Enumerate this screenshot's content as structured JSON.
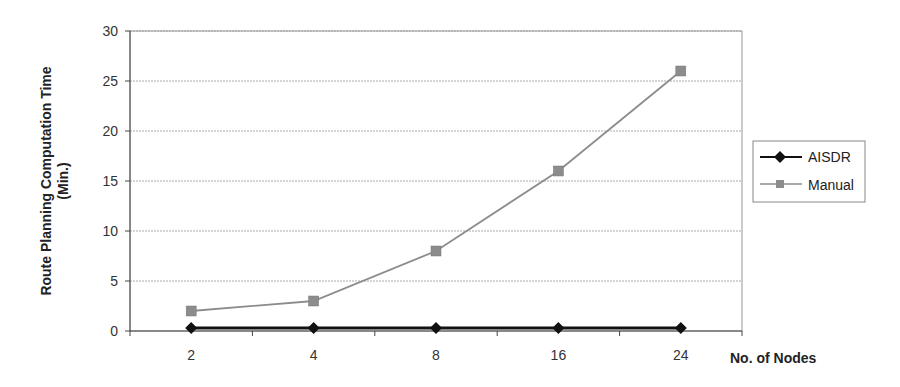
{
  "chart_data": {
    "type": "line",
    "title": "",
    "xlabel": "No. of Nodes",
    "ylabel": "Route Planning Computation Time (Min.)",
    "ylabel_lines": [
      "Route Planning Computation Time",
      "(Min.)"
    ],
    "categories": [
      "2",
      "4",
      "8",
      "16",
      "24"
    ],
    "ylim": [
      0,
      30
    ],
    "yticks": [
      0,
      5,
      10,
      15,
      20,
      25,
      30
    ],
    "grid": true,
    "legend": "right",
    "series": [
      {
        "name": "AISDR",
        "marker": "diamond",
        "color": "#111111",
        "values": [
          0.3,
          0.3,
          0.3,
          0.3,
          0.3
        ]
      },
      {
        "name": "Manual",
        "marker": "square",
        "color": "#8c8c8c",
        "values": [
          2,
          3,
          8,
          16,
          26
        ]
      }
    ]
  }
}
